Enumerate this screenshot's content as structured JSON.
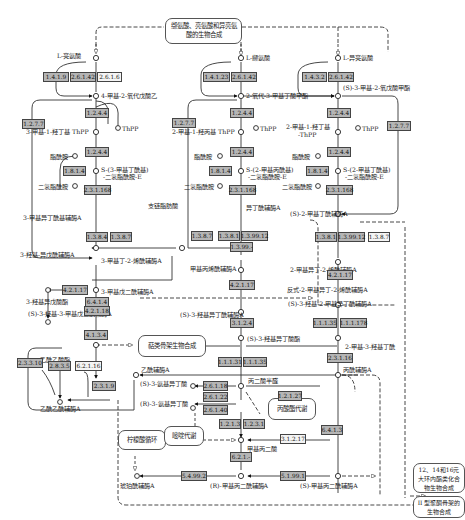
{
  "pathways": {
    "top": "缬氨酸、亮氨酸和异亮氨酸的生物合成",
    "terpenoid": "萜类骨架生物合成",
    "tca": "柠檬酸循环",
    "pyrimidine": "嘧啶代谢",
    "propanoate": "丙酸酯代谢",
    "macrolide": "12、14和16元大环内酯类化合物生物合成",
    "polyketide2": "II 型聚酮骨架的生物合成"
  },
  "compounds": {
    "leucine": "L-亮氨酸",
    "valine": "L-缬氨酸",
    "isoleucine": "L-异亮氨酸",
    "mopa": "4-甲基-2-氧代戊酸乙",
    "kiv": "2-氧代-3-甲基丁酸甲酯",
    "kmv": "(S)-3-甲基-2-氧戊酸甲酯",
    "htpp1": "3-甲基-1-羟丁基 ThPP",
    "htpp2": "2-甲基-1-羟丙基 ThPP",
    "htpp3a": "2-甲基-1-羟丁基",
    "htpp3b": "-ThPP",
    "thpp": "ThPP",
    "lipoamide": "脂酰胺",
    "dihydrolipo": "二氢脂酰胺",
    "sdl1a": "S-(3-甲基丁酰基)",
    "sdl1b": "-二氢脂酰胺-E",
    "sdl2a": "S-(2-甲基丙酰基)",
    "sdl2b": "-二氢脂酰胺-E",
    "sdl3a": "S-(2-甲基丁酰基)",
    "sdl3b": "-二氢脂酰胺-E",
    "ivcoa": "3-甲基异丁酰基辅酶A",
    "ibcoa": "异丁酰辅酶A",
    "mbcoa": "(S)-2-甲基丁酰辅酶A",
    "bcfa": "支链脂肪酸",
    "hivcoa": "3-羟基-异戊酰辅酶A",
    "mcrcoa": "3-甲基丁-2-烯酰辅酶A",
    "hiva": "3-羟基异戊酸酯",
    "mgcoa": "3-甲基戊二酰辅酶A",
    "hmgcoa": "(S)-3-羟基-3-甲基戊二酰辅酶A",
    "macoa": "甲基丙烯酰辅酶A",
    "tigcoa": "反式-2-甲基异丁-2-烯酰辅酶A",
    "mbecoa": "2-甲基异丁-2-烯酰辅酶A",
    "hibcoa": "(S)-3-羟基异丁酰辅酶A",
    "hmbcoa": "(S)-3-羟基-2-甲基异丁酰辅酶A",
    "hib": "(S)-3-羟基异丁酸酯",
    "mhb": "2-甲基-3-羟基丁酰",
    "acaccoa": "乙酰乙酰辅酶A",
    "acac": "乙酰乙酸酯",
    "accoa": "乙酰辅酶A",
    "samiba": "(S)-3-氨基异丁酸",
    "ramiba": "(R)-3-氨基异丁酸",
    "msa": "丙二酸半醛",
    "msa2": "甲基丙二酸半醛",
    "prcoa": "丙酰辅酶A",
    "mma": "甲基丙二酸",
    "succoa": "琥珀酰辅酶A",
    "rmmcoa": "(R)-甲基丙二酰辅酶A",
    "smmcoa": "(S)-甲基丙二酰辅酶A"
  },
  "enzymes": {
    "e1": "1.4.1.9",
    "e2": "2.6.1.42",
    "e3": "2.6.1.6",
    "e4": "1.4.1.23",
    "e5": "2.6.1.42",
    "e6": "1.4.3.2",
    "e7": "2.6.1.42",
    "e8": "1.2.7.7",
    "e9": "1.2.4.4",
    "e10": "1.2.4.4",
    "e11": "1.8.1.4",
    "e12": "2.3.1.168",
    "e13": "1.2.7.7",
    "e14": "1.2.4.4",
    "e15": "1.2.4.4",
    "e16": "1.8.1.4",
    "e17": "2.3.1.168",
    "e18": "1.2.7.7",
    "e19": "1.2.4.4",
    "e20": "1.2.4.4",
    "e21": "1.8.1.4",
    "e22": "2.3.1.168",
    "e23": "1.3.8.4",
    "e24": "1.3.8.7",
    "e25": "1.3.8.7",
    "e26": "1.3.8.1",
    "e27": "1.3.99.12",
    "e28": "1.3.99.-",
    "e29": "1.3.8.1",
    "e30": "1.3.99.12",
    "e31": "1.3.8.7",
    "e32": "4.2.1.17",
    "e33": "6.4.1.4",
    "e34": "4.2.1.18",
    "e35": "4.1.3.4",
    "e36": "4.2.1.17",
    "e37": "3.1.2.4",
    "e38": "4.2.1.17",
    "e39": "1.1.1.31",
    "e40": "1.1.1.35",
    "e41": "1.1.1.35",
    "e42": "1.1.1.178",
    "e43": "2.3.3.10",
    "e44": "2.8.3.5",
    "e45": "6.2.1.16",
    "e46": "2.3.1.9",
    "e47": "2.3.1.16",
    "e48": "2.6.1.18",
    "e49": "2.6.1.22",
    "e50": "2.6.1.40",
    "e51": "1.2.1.27",
    "e52": "1.2.1.3",
    "e53": "1.2.3.1",
    "e54": "3.1.2.17",
    "e55": "6.4.1.3",
    "e56": "6.2.1.-",
    "e57": "5.4.99.2",
    "e58": "5.1.99.1"
  }
}
